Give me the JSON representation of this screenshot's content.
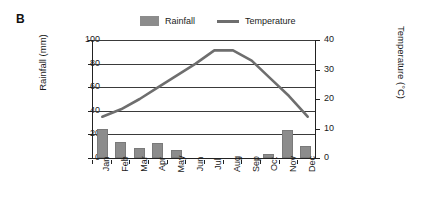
{
  "panel": {
    "letter": "B"
  },
  "legend": [
    {
      "label": "Rainfall",
      "marker": "swatch-icon",
      "color": "#8c8c8c"
    },
    {
      "label": "Temperature",
      "marker": "line-icon",
      "color": "#6e6e6e"
    }
  ],
  "chart_data": {
    "type": "bar",
    "title": "",
    "subtitle": "",
    "xlabel": "",
    "ylabel": "Rainfall (mm)",
    "y2label": "Temperature (°C)",
    "categories": [
      "Jan",
      "Feb",
      "Mar",
      "Apr",
      "May",
      "Jun",
      "Jul",
      "Aug",
      "Sep",
      "Oct",
      "Nov",
      "Dec"
    ],
    "ylim": [
      0,
      100
    ],
    "y2lim": [
      0,
      40
    ],
    "yticks": [
      0,
      20,
      40,
      60,
      80,
      100
    ],
    "y2ticks": [
      0,
      10,
      20,
      30,
      40
    ],
    "grid": true,
    "legend_position": "top",
    "series": [
      {
        "name": "Rainfall",
        "type": "bar",
        "axis": "left",
        "unit": "mm",
        "color": "#8c8c8c",
        "values": [
          25,
          13.5,
          8.5,
          13,
          6.5,
          0,
          0,
          0,
          0,
          3,
          24,
          10
        ]
      },
      {
        "name": "Temperature",
        "type": "line",
        "axis": "right",
        "unit": "°C",
        "color": "#6e6e6e",
        "values": [
          14,
          16.5,
          20,
          24,
          28,
          32,
          36.5,
          36.5,
          33,
          27,
          21,
          14
        ]
      }
    ]
  }
}
